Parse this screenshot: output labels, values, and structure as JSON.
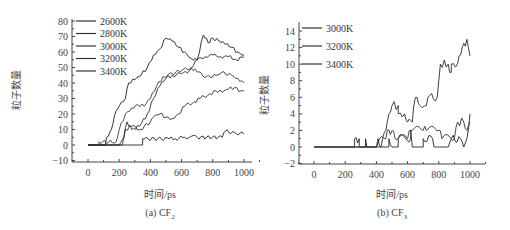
{
  "chart_data": [
    {
      "type": "line",
      "title": "(a) CF2",
      "caption_main": "(a) CF",
      "caption_sub": "2",
      "xlabel": "时间/ps",
      "ylabel": "粒子数量",
      "xlim": [
        -100,
        1100
      ],
      "ylim": [
        -10,
        80
      ],
      "xticks": [
        0,
        200,
        400,
        600,
        800,
        1000
      ],
      "yticks": [
        -10,
        0,
        10,
        20,
        30,
        40,
        50,
        60,
        70,
        80
      ],
      "legend": [
        "2600K",
        "2800K",
        "3000K",
        "3200K",
        "3400K"
      ],
      "legend_position": "upper-left",
      "grid": false,
      "series": [
        {
          "name": "2600K",
          "points": [
            [
              0,
              0
            ],
            [
              350,
              0
            ],
            [
              350,
              4
            ],
            [
              520,
              4
            ],
            [
              560,
              4
            ],
            [
              620,
              5
            ],
            [
              700,
              5
            ],
            [
              860,
              5
            ],
            [
              880,
              9
            ],
            [
              940,
              8
            ],
            [
              1000,
              7
            ]
          ]
        },
        {
          "name": "2800K",
          "points": [
            [
              0,
              0
            ],
            [
              220,
              0
            ],
            [
              240,
              10
            ],
            [
              280,
              12
            ],
            [
              340,
              10
            ],
            [
              360,
              12
            ],
            [
              400,
              15
            ],
            [
              420,
              18
            ],
            [
              460,
              20
            ],
            [
              500,
              18
            ],
            [
              540,
              17
            ],
            [
              580,
              20
            ],
            [
              620,
              25
            ],
            [
              680,
              28
            ],
            [
              720,
              30
            ],
            [
              780,
              33
            ],
            [
              820,
              35
            ],
            [
              860,
              34
            ],
            [
              900,
              36
            ],
            [
              940,
              37
            ],
            [
              980,
              35
            ],
            [
              1000,
              35
            ]
          ]
        },
        {
          "name": "3000K",
          "points": [
            [
              0,
              0
            ],
            [
              200,
              0
            ],
            [
              230,
              5
            ],
            [
              250,
              15
            ],
            [
              280,
              10
            ],
            [
              330,
              12
            ],
            [
              380,
              20
            ],
            [
              420,
              30
            ],
            [
              460,
              38
            ],
            [
              500,
              43
            ],
            [
              540,
              45
            ],
            [
              600,
              46
            ],
            [
              650,
              48
            ],
            [
              700,
              55
            ],
            [
              750,
              57
            ],
            [
              800,
              58
            ],
            [
              850,
              57
            ],
            [
              900,
              57
            ],
            [
              950,
              55
            ],
            [
              1000,
              57
            ]
          ]
        },
        {
          "name": "3200K",
          "points": [
            [
              0,
              0
            ],
            [
              70,
              0
            ],
            [
              70,
              2
            ],
            [
              180,
              2
            ],
            [
              200,
              10
            ],
            [
              240,
              20
            ],
            [
              280,
              24
            ],
            [
              320,
              26
            ],
            [
              360,
              25
            ],
            [
              400,
              30
            ],
            [
              440,
              38
            ],
            [
              480,
              44
            ],
            [
              540,
              46
            ],
            [
              600,
              48
            ],
            [
              660,
              50
            ],
            [
              700,
              47
            ],
            [
              760,
              44
            ],
            [
              820,
              45
            ],
            [
              860,
              47
            ],
            [
              920,
              45
            ],
            [
              960,
              43
            ],
            [
              1000,
              40
            ]
          ]
        },
        {
          "name": "3400K",
          "points": [
            [
              0,
              0
            ],
            [
              110,
              0
            ],
            [
              120,
              5
            ],
            [
              150,
              10
            ],
            [
              170,
              19
            ],
            [
              200,
              25
            ],
            [
              240,
              30
            ],
            [
              260,
              40
            ],
            [
              300,
              42
            ],
            [
              340,
              45
            ],
            [
              380,
              50
            ],
            [
              420,
              58
            ],
            [
              460,
              62
            ],
            [
              500,
              69
            ],
            [
              540,
              67
            ],
            [
              580,
              63
            ],
            [
              620,
              60
            ],
            [
              660,
              56
            ],
            [
              700,
              55
            ],
            [
              740,
              71
            ],
            [
              770,
              66
            ],
            [
              800,
              69
            ],
            [
              840,
              67
            ],
            [
              880,
              65
            ],
            [
              920,
              63
            ],
            [
              960,
              60
            ],
            [
              1000,
              58
            ]
          ]
        }
      ]
    },
    {
      "type": "line",
      "title": "(b) CF3",
      "caption_main": "(b) CF",
      "caption_sub": "3",
      "xlabel": "时间/ps",
      "ylabel": "粒子数量",
      "xlim": [
        -100,
        1100
      ],
      "ylim": [
        -2,
        15
      ],
      "xticks": [
        0,
        200,
        400,
        600,
        800,
        1000
      ],
      "yticks": [
        -2,
        0,
        2,
        4,
        6,
        8,
        10,
        12,
        14
      ],
      "legend": [
        "3000K",
        "3200K",
        "3400K"
      ],
      "legend_position": "upper-left",
      "grid": false,
      "series": [
        {
          "name": "3000K",
          "points": [
            [
              0,
              0
            ],
            [
              260,
              0
            ],
            [
              260,
              1
            ],
            [
              290,
              1
            ],
            [
              290,
              0
            ],
            [
              330,
              0
            ],
            [
              330,
              1
            ],
            [
              340,
              0
            ],
            [
              400,
              0
            ],
            [
              410,
              1
            ],
            [
              430,
              0
            ],
            [
              480,
              0
            ],
            [
              480,
              1
            ],
            [
              500,
              0
            ],
            [
              540,
              0
            ],
            [
              540,
              1
            ],
            [
              620,
              1
            ],
            [
              620,
              2
            ],
            [
              630,
              0
            ],
            [
              700,
              0
            ],
            [
              700,
              1
            ],
            [
              760,
              1
            ],
            [
              770,
              0
            ],
            [
              860,
              0
            ],
            [
              880,
              1
            ],
            [
              940,
              1
            ],
            [
              960,
              0
            ],
            [
              980,
              1
            ],
            [
              1000,
              4
            ]
          ]
        },
        {
          "name": "3200K",
          "points": [
            [
              0,
              0
            ],
            [
              400,
              0
            ],
            [
              420,
              1
            ],
            [
              460,
              1
            ],
            [
              470,
              2
            ],
            [
              500,
              2
            ],
            [
              520,
              1
            ],
            [
              600,
              1
            ],
            [
              620,
              2
            ],
            [
              700,
              2
            ],
            [
              720,
              2
            ],
            [
              800,
              2
            ],
            [
              820,
              1
            ],
            [
              900,
              1
            ],
            [
              920,
              3
            ],
            [
              960,
              3
            ],
            [
              980,
              2
            ],
            [
              1000,
              3
            ]
          ]
        },
        {
          "name": "3400K",
          "points": [
            [
              0,
              0
            ],
            [
              430,
              0
            ],
            [
              440,
              1
            ],
            [
              460,
              2
            ],
            [
              480,
              4
            ],
            [
              500,
              5
            ],
            [
              540,
              5
            ],
            [
              540,
              4
            ],
            [
              580,
              4
            ],
            [
              600,
              3
            ],
            [
              630,
              3
            ],
            [
              640,
              5
            ],
            [
              660,
              6
            ],
            [
              680,
              5
            ],
            [
              720,
              5
            ],
            [
              730,
              6
            ],
            [
              790,
              6
            ],
            [
              800,
              8
            ],
            [
              810,
              10
            ],
            [
              860,
              10
            ],
            [
              880,
              9
            ],
            [
              880,
              10
            ],
            [
              920,
              10
            ],
            [
              930,
              11
            ],
            [
              950,
              12
            ],
            [
              980,
              13
            ],
            [
              990,
              12
            ],
            [
              1000,
              11
            ]
          ]
        }
      ]
    }
  ]
}
